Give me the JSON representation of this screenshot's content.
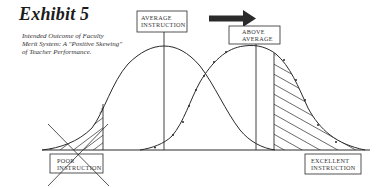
{
  "exhibit": {
    "title": "Exhibit 5",
    "subtitle_lines": [
      "Intended Outcome of Faculty",
      "Merit System: A \"Positive Skewing\"",
      "of Teacher Performance."
    ]
  },
  "labels": {
    "average": [
      "AVERAGE",
      "INSTRUCTION"
    ],
    "above_average": [
      "ABOVE",
      "AVERAGE"
    ],
    "poor": [
      "POOR",
      "INSTRUCTION"
    ],
    "excellent": [
      "EXCELLENT",
      "INSTRUCTION"
    ]
  },
  "diagram": {
    "shift_arrow": "right-arrow",
    "curves": [
      {
        "name": "current-distribution",
        "peak_label": "AVERAGE INSTRUCTION"
      },
      {
        "name": "intended-distribution",
        "peak_label": "ABOVE AVERAGE",
        "marker": "arrow-ticks"
      }
    ],
    "regions": [
      {
        "name": "poor-instruction-tail",
        "style": "hatched",
        "crossed_out": true
      },
      {
        "name": "excellent-instruction-tail",
        "style": "hatched",
        "crossed_out": false
      }
    ]
  },
  "colors": {
    "ink": "#2a2a2a",
    "background": "#ffffff"
  }
}
